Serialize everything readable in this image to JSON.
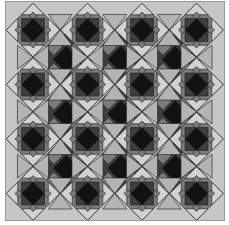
{
  "image": {
    "description": "Geometric quilt-like tessellation pattern in grayscale",
    "grid": {
      "rows": 4,
      "cols": 4
    },
    "period": 54.5,
    "origin": [
      27,
      28
    ],
    "colors": {
      "background": "#c6c6c6",
      "light": "#d2d2d2",
      "light_alt": "#b4b4b4",
      "mid": "#7c7c7c",
      "dark": "#3e3e3e",
      "black": "#121212",
      "outline": "#1a1a1a"
    },
    "motifs": [
      "star-block",
      "bow-tie",
      "dark-diamond"
    ]
  }
}
